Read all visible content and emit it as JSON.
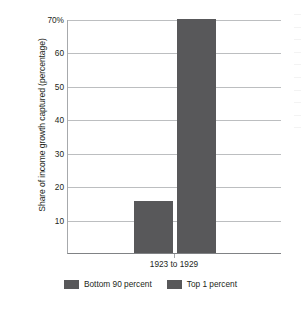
{
  "chart_data": {
    "type": "bar",
    "title": "",
    "xlabel": "",
    "ylabel": "Share of income growth captured (percentage)",
    "categories": [
      "1923 to 1929"
    ],
    "series": [
      {
        "name": "Bottom 90 percent",
        "values": [
          15.5
        ]
      },
      {
        "name": "Top 1 percent",
        "values": [
          70
        ]
      }
    ],
    "ylim": [
      0,
      70
    ],
    "yticks": [
      {
        "value": 70,
        "label": "70%"
      },
      {
        "value": 60,
        "label": "60"
      },
      {
        "value": 50,
        "label": "50"
      },
      {
        "value": 40,
        "label": "40"
      },
      {
        "value": 30,
        "label": "30"
      },
      {
        "value": 20,
        "label": "20"
      },
      {
        "value": 10,
        "label": "10"
      }
    ],
    "grid": true,
    "legend_position": "bottom",
    "bar_color": "#58585a",
    "gridline_color": "#bcbec0"
  },
  "legend": {
    "items": [
      {
        "label": "Bottom 90 percent",
        "color": "#58585a"
      },
      {
        "label": "Top 1 percent",
        "color": "#58585a"
      }
    ]
  }
}
